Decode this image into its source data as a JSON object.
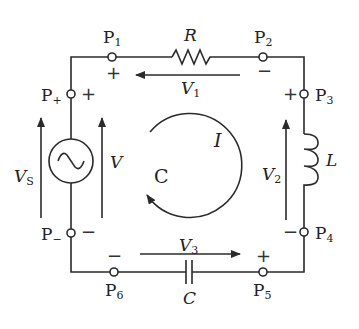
{
  "diagram": {
    "type": "series RLC circuit with AC source",
    "colors": {
      "line": "#2a2a2a",
      "background": "#ffffff"
    },
    "nodes": {
      "p1": {
        "label": "P",
        "sub": "1"
      },
      "p2": {
        "label": "P",
        "sub": "2"
      },
      "p3": {
        "label": "P",
        "sub": "3"
      },
      "p4": {
        "label": "P",
        "sub": "4"
      },
      "p5": {
        "label": "P",
        "sub": "5"
      },
      "p6": {
        "label": "P",
        "sub": "6"
      },
      "p_plus": {
        "label": "P",
        "sub": "+"
      },
      "p_minus": {
        "label": "P",
        "sub": "−"
      }
    },
    "components": {
      "resistor": {
        "label": "R"
      },
      "inductor": {
        "label": "L"
      },
      "capacitor": {
        "label": "C"
      },
      "source": {
        "symbol": "~"
      }
    },
    "voltages": {
      "vs": {
        "label": "V",
        "sub": "S"
      },
      "v": {
        "label": "V"
      },
      "v1": {
        "label": "V",
        "sub": "1"
      },
      "v2": {
        "label": "V",
        "sub": "2"
      },
      "v3": {
        "label": "V",
        "sub": "3"
      }
    },
    "loop": {
      "current_label": "I",
      "loop_label": "C"
    },
    "signs": {
      "plus": "+",
      "minus": "−"
    }
  }
}
